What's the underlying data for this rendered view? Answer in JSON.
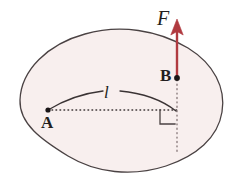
{
  "figure": {
    "kind": "physics-free-body-diagram",
    "background_color": "#ffffff",
    "body": {
      "name": "rigid-body-blob",
      "fill_color": "#f8efee",
      "stroke_color": "#4a4243",
      "stroke_width": 1.3
    },
    "points": [
      {
        "id": "A",
        "label": "A",
        "x": 48,
        "y": 110,
        "label_x": 41,
        "label_y": 114,
        "role": "pivot-point",
        "dot_color": "#1a1617",
        "dot_radius": 2.6
      },
      {
        "id": "B",
        "label": "B",
        "x": 177,
        "y": 78,
        "label_x": 160,
        "label_y": 67,
        "role": "force-application-point",
        "dot_color": "#1a1617",
        "dot_radius": 2.8
      }
    ],
    "force_vector": {
      "name": "force-arrow-F",
      "label": "F",
      "label_x": 157,
      "label_y": 8,
      "color": "#b03a40",
      "shaft_width": 2.4,
      "from_x": 177,
      "from_y": 78,
      "to_x": 177,
      "to_y": 21,
      "direction": "up"
    },
    "moment_arm": {
      "name": "moment-arm-dotted-line",
      "label": "",
      "from_x": 48,
      "from_y": 110,
      "to_x": 177,
      "to_y": 110,
      "color": "#3a3334",
      "style": "dotted"
    },
    "line_of_action": {
      "name": "line-of-action-dotted",
      "from_x": 177,
      "from_y": 78,
      "to_x": 177,
      "to_y": 152,
      "color": "#8a7e7e",
      "style": "dotted"
    },
    "arc": {
      "name": "distance-arc",
      "label": "l",
      "label_x": 104,
      "label_y": 84,
      "color": "#3a3334",
      "from_x": 48,
      "from_y": 110,
      "to_x": 176,
      "to_y": 111,
      "bulge": "upward"
    },
    "right_angle": {
      "name": "right-angle-marker",
      "x": 160,
      "y": 110,
      "size": 15,
      "color": "#4a4243"
    }
  }
}
